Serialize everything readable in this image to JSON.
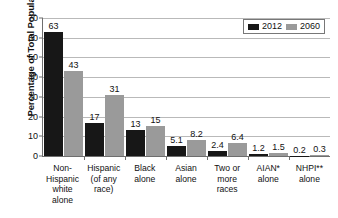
{
  "chart_data": {
    "type": "bar",
    "title": "",
    "xlabel": "",
    "ylabel": "Percentage of Total Population",
    "ylim": [
      0,
      70
    ],
    "ytick_step": 10,
    "yticks": [
      0,
      10,
      20,
      30,
      40,
      50,
      60,
      70
    ],
    "ytick_labels": [
      "0",
      "10",
      "20",
      "30",
      "40",
      "50",
      "60",
      "70"
    ],
    "grid": true,
    "legend_position": "top-right",
    "categories": [
      "Non-Hispanic white alone",
      "Hispanic (of any race)",
      "Black alone",
      "Asian alone",
      "Two or more races",
      "AIAN* alone",
      "NHPI** alone"
    ],
    "category_lines": [
      [
        "Non-",
        "Hispanic",
        "white",
        "alone"
      ],
      [
        "Hispanic",
        "(of any",
        "race)"
      ],
      [
        "Black",
        "alone"
      ],
      [
        "Asian",
        "alone"
      ],
      [
        "Two or",
        "more",
        "races"
      ],
      [
        "AIAN*",
        "alone"
      ],
      [
        "NHPI**",
        "alone"
      ]
    ],
    "series": [
      {
        "name": "2012",
        "color": "#171717",
        "values": [
          63,
          17,
          13,
          5.1,
          2.4,
          1.2,
          0.2
        ],
        "labels": [
          "63",
          "17",
          "13",
          "5.1",
          "2.4",
          "1.2",
          "0.2"
        ]
      },
      {
        "name": "2060",
        "color": "#9a9a9a",
        "values": [
          43,
          31,
          15,
          8.2,
          6.4,
          1.5,
          0.3
        ],
        "labels": [
          "43",
          "31",
          "15",
          "8.2",
          "6.4",
          "1.5",
          "0.3"
        ]
      }
    ]
  }
}
